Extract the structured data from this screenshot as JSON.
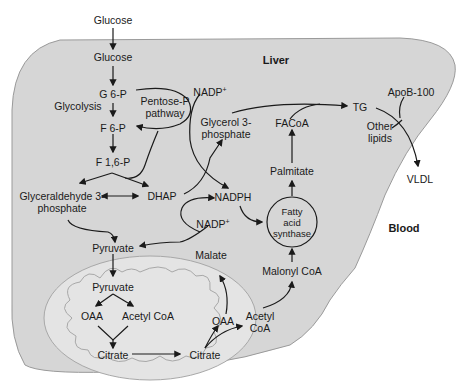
{
  "regions": {
    "liver": "Liver",
    "blood": "Blood"
  },
  "pathway_labels": {
    "glycolysis": "Glycolysis",
    "pentose_line1": "Pentose-P",
    "pentose_line2": "pathway"
  },
  "metabolites": {
    "glucose_outside": "Glucose",
    "glucose_inside": "Glucose",
    "g6p": "G 6-P",
    "f6p": "F 6-P",
    "f16p": "F 1,6-P",
    "gap_line1": "Glyceraldehyde 3-",
    "gap_line2": "phosphate",
    "dhap": "DHAP",
    "glycerol3p_line1": "Glycerol 3-",
    "glycerol3p_line2": "phosphate",
    "nadp_top": "NADP",
    "nadp_top_sup": "+",
    "nadph": "NADPH",
    "nadp_mid": "NADP",
    "nadp_mid_sup": "+",
    "pyruvate_cyto": "Pyruvate",
    "malate": "Malate",
    "oaa_cyto": "OAA",
    "acetylcoa_cyto_line1": "Acetyl",
    "acetylcoa_cyto_line2": "CoA",
    "citrate_cyto": "Citrate",
    "malonylcoa": "Malonyl CoA",
    "fas_line1": "Fatty",
    "fas_line2": "acid",
    "fas_line3": "synthase",
    "palmitate": "Palmitate",
    "facoa": "FACoA",
    "tg": "TG",
    "apob100": "ApoB-100",
    "other_lipids_line1": "Other",
    "other_lipids_line2": "lipids",
    "vldl": "VLDL"
  },
  "mitochondrion": {
    "pyruvate": "Pyruvate",
    "oaa": "OAA",
    "acetylcoa": "Acetyl CoA",
    "citrate": "Citrate"
  },
  "colors": {
    "liver_fill": "#d6d6d6",
    "liver_stroke": "#9a9a9a",
    "mito_fill": "#e4e4e4",
    "mito_stroke": "#a8a8a8",
    "arrow": "#1a1a1a",
    "background": "#ffffff"
  }
}
